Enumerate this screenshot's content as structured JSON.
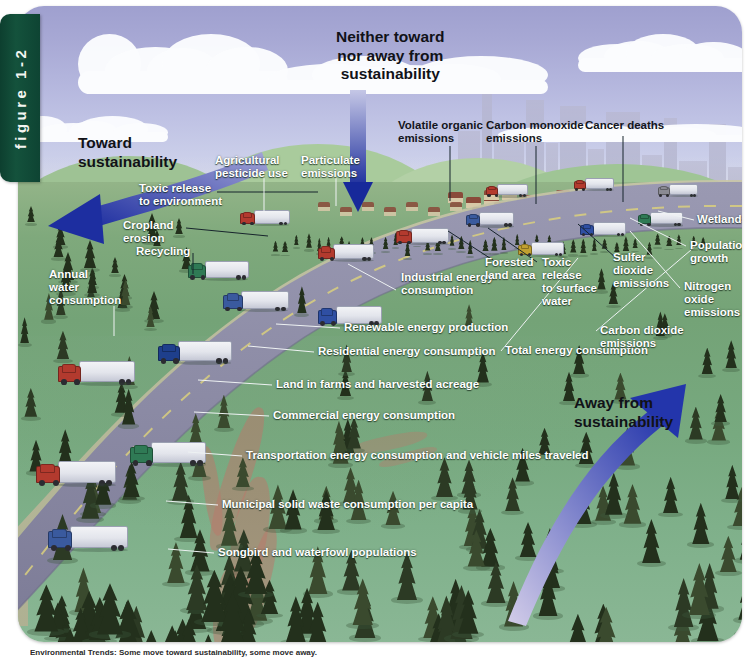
{
  "figure": {
    "tab_label": "figure 1-2",
    "caption": "Environmental Trends: Some move toward sustainability, some move away."
  },
  "directional_labels": [
    {
      "id": "toward",
      "text": "Toward\nsustainability",
      "x": 60,
      "y": 128,
      "style": "big-dark"
    },
    {
      "id": "neither",
      "text": "Neither toward\nnor away from\nsustainability",
      "x": 318,
      "y": 22,
      "style": "big-dark"
    },
    {
      "id": "away",
      "text": "Away from\nsustainability",
      "x": 556,
      "y": 388,
      "style": "big-dark"
    }
  ],
  "arrows": {
    "toward": {
      "color_start": "#8d8ecb",
      "color_end": "#1e2f9e",
      "direction": "down-left"
    },
    "neither": {
      "color_start": "#b9bcdf",
      "color_end": "#1a2f9b",
      "direction": "down"
    },
    "away": {
      "color_start": "#cfc9e8",
      "color_end": "#2438a6",
      "direction": "up-right"
    }
  },
  "indicator_labels": [
    {
      "text": "Toxic release\nto environment",
      "x": 121,
      "y": 176,
      "align": "left",
      "color": "white"
    },
    {
      "text": "Cropland\nerosion",
      "x": 105,
      "y": 213,
      "align": "left",
      "color": "white"
    },
    {
      "text": "Recycling",
      "x": 118,
      "y": 239,
      "align": "left",
      "color": "white"
    },
    {
      "text": "Annual\nwater\nconsumption",
      "x": 31,
      "y": 262,
      "align": "left",
      "color": "white"
    },
    {
      "text": "Agricultural\npesticide use",
      "x": 197,
      "y": 148,
      "align": "left",
      "color": "white"
    },
    {
      "text": "Particulate\nemissions",
      "x": 283,
      "y": 148,
      "align": "left",
      "color": "white"
    },
    {
      "text": "Volatile organic\nemissions",
      "x": 380,
      "y": 113,
      "align": "left",
      "color": "dark"
    },
    {
      "text": "Carbon monoxide\nemissions",
      "x": 468,
      "y": 113,
      "align": "left",
      "color": "dark"
    },
    {
      "text": "Cancer deaths",
      "x": 567,
      "y": 113,
      "align": "left",
      "color": "dark"
    },
    {
      "text": "Industrial energy\nconsumption",
      "x": 383,
      "y": 265,
      "align": "left",
      "color": "white"
    },
    {
      "text": "Renewable energy production",
      "x": 326,
      "y": 315,
      "align": "left",
      "color": "white"
    },
    {
      "text": "Residential energy consumption",
      "x": 300,
      "y": 339,
      "align": "left",
      "color": "white"
    },
    {
      "text": "Land in farms and harvested acreage",
      "x": 258,
      "y": 372,
      "align": "left",
      "color": "white"
    },
    {
      "text": "Commercial energy consumption",
      "x": 255,
      "y": 403,
      "align": "left",
      "color": "white"
    },
    {
      "text": "Transportation energy consumption and vehicle miles traveled",
      "x": 228,
      "y": 443,
      "align": "left",
      "color": "white"
    },
    {
      "text": "Municipal solid waste consumption per capita",
      "x": 204,
      "y": 492,
      "align": "left",
      "color": "white"
    },
    {
      "text": "Songbird and waterfowl populations",
      "x": 200,
      "y": 540,
      "align": "left",
      "color": "white"
    },
    {
      "text": "Forested\nland area",
      "x": 467,
      "y": 250,
      "align": "left",
      "color": "white"
    },
    {
      "text": "Toxic\nrelease\nto surface\nwater",
      "x": 524,
      "y": 250,
      "align": "left",
      "color": "white"
    },
    {
      "text": "Total energy consumption",
      "x": 487,
      "y": 338,
      "align": "left",
      "color": "white"
    },
    {
      "text": "Sulfer\ndioxide\nemissions",
      "x": 595,
      "y": 245,
      "align": "left",
      "color": "white"
    },
    {
      "text": "Wetlands",
      "x": 679,
      "y": 207,
      "align": "left",
      "color": "white"
    },
    {
      "text": "Population\ngrowth",
      "x": 672,
      "y": 233,
      "align": "left",
      "color": "white"
    },
    {
      "text": "Nitrogen\noxide\nemissions",
      "x": 666,
      "y": 274,
      "align": "left",
      "color": "white"
    },
    {
      "text": "Carbon dioxide emissions",
      "x": 582,
      "y": 318,
      "align": "left",
      "color": "white"
    }
  ],
  "colors": {
    "sky_top": "#9fa0cf",
    "sky_bottom": "#dfe3ef",
    "ground_green": "#7fa97c",
    "hill_light": "#9cc08f",
    "road_gray": "#8d8ca6",
    "tab_green": "#14523c",
    "arrow_blue": "#1e2f9e",
    "truck_white": "#e9ebf1",
    "tree_dark": "#2c3a24",
    "erosion_red": "#b87a6c"
  },
  "scene": {
    "hills": [
      {
        "x": -40,
        "y": 150,
        "w": 300,
        "h": 120,
        "c": "#9ec294"
      },
      {
        "x": 150,
        "y": 138,
        "w": 300,
        "h": 110,
        "c": "#a9cb9c"
      },
      {
        "x": 330,
        "y": 152,
        "w": 260,
        "h": 95,
        "c": "#b3d0a6"
      },
      {
        "x": 430,
        "y": 158,
        "w": 340,
        "h": 90,
        "c": "#9fc595"
      }
    ],
    "clouds": [
      {
        "x": 60,
        "y": 28,
        "w": 210,
        "h": 60
      },
      {
        "x": 250,
        "y": 50,
        "w": 280,
        "h": 38
      },
      {
        "x": 560,
        "y": 28,
        "w": 170,
        "h": 38
      },
      {
        "x": 0,
        "y": 110,
        "w": 150,
        "h": 26
      },
      {
        "x": 480,
        "y": 118,
        "w": 260,
        "h": 18
      }
    ],
    "trucks": [
      {
        "x": 30,
        "y": 520,
        "s": 1.0,
        "cab": "#3a5a9e",
        "dir": "l"
      },
      {
        "x": 18,
        "y": 455,
        "s": 1.0,
        "cab": "#b33a2e",
        "dir": "l"
      },
      {
        "x": 112,
        "y": 436,
        "s": 0.95,
        "cab": "#2f7a55",
        "dir": "l"
      },
      {
        "x": 40,
        "y": 355,
        "s": 0.96,
        "cab": "#b33a2e",
        "dir": "l"
      },
      {
        "x": 140,
        "y": 335,
        "s": 0.92,
        "cab": "#1e3f8c",
        "dir": "l"
      },
      {
        "x": 300,
        "y": 300,
        "s": 0.8,
        "cab": "#2f4fa3",
        "dir": "l"
      },
      {
        "x": 205,
        "y": 285,
        "s": 0.82,
        "cab": "#3a5a9e",
        "dir": "l"
      },
      {
        "x": 170,
        "y": 255,
        "s": 0.76,
        "cab": "#2f7a55",
        "dir": "l"
      },
      {
        "x": 300,
        "y": 238,
        "s": 0.7,
        "cab": "#b33a2e",
        "dir": "l"
      },
      {
        "x": 378,
        "y": 222,
        "s": 0.66,
        "cab": "#b33a2e",
        "dir": "l"
      },
      {
        "x": 222,
        "y": 204,
        "s": 0.62,
        "cab": "#b33a2e",
        "dir": "l"
      },
      {
        "x": 448,
        "y": 206,
        "s": 0.6,
        "cab": "#3a5a9e",
        "dir": "l"
      },
      {
        "x": 500,
        "y": 236,
        "s": 0.58,
        "cab": "#c0a030",
        "dir": "l"
      },
      {
        "x": 562,
        "y": 216,
        "s": 0.58,
        "cab": "#2f4fa3",
        "dir": "l"
      },
      {
        "x": 620,
        "y": 206,
        "s": 0.56,
        "cab": "#2f7a55",
        "dir": "l"
      },
      {
        "x": 468,
        "y": 178,
        "s": 0.52,
        "cab": "#b33a2e",
        "dir": "l"
      },
      {
        "x": 556,
        "y": 172,
        "s": 0.5,
        "cab": "#b33a2e",
        "dir": "l"
      },
      {
        "x": 640,
        "y": 178,
        "s": 0.5,
        "cab": "#8a8a93",
        "dir": "l"
      }
    ]
  }
}
